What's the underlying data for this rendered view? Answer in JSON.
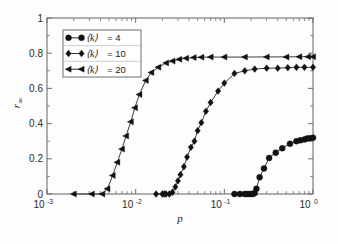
{
  "figure": {
    "background_color": "#fdfdfd",
    "axes_color": "#6f6f6f",
    "data_color": "#111111"
  },
  "chart_data": {
    "type": "line",
    "title": "",
    "subtitle": "",
    "xlabel": "p",
    "ylabel": "r",
    "ylabel_sub": "∞",
    "xscale": "log",
    "yscale": "linear",
    "xlim": [
      0.001,
      1.0
    ],
    "ylim": [
      0,
      1
    ],
    "grid": false,
    "legend_position": "upper-left",
    "xticks": [
      0.001,
      0.01,
      0.1,
      1
    ],
    "xticklabels": [
      "10",
      "10",
      "10",
      "10"
    ],
    "xtick_exponents": [
      "-3",
      "-2",
      "-1",
      "0"
    ],
    "yticks": [
      0,
      0.2,
      0.4,
      0.6,
      0.8,
      1
    ],
    "yticklabels": [
      "0",
      "0.2",
      "0.4",
      "0.6",
      "0.8",
      "1"
    ],
    "series": [
      {
        "name": "⟨k⟩ = 4",
        "legend_label": "= 4",
        "legend_k": "⟨k⟩",
        "marker": "circle",
        "x": [
          0.13,
          0.15,
          0.17,
          0.18,
          0.19,
          0.2,
          0.21,
          0.22,
          0.23,
          0.25,
          0.28,
          0.32,
          0.38,
          0.45,
          0.55,
          0.65,
          0.72,
          0.8,
          0.86,
          0.92,
          1.0
        ],
        "y": [
          0.0,
          0.0,
          0.0,
          0.0,
          0.0,
          0.0,
          0.0,
          0.005,
          0.03,
          0.095,
          0.145,
          0.205,
          0.235,
          0.26,
          0.285,
          0.3,
          0.305,
          0.31,
          0.315,
          0.317,
          0.32
        ]
      },
      {
        "name": "⟨k⟩ = 10",
        "legend_label": "= 10",
        "legend_k": "⟨k⟩",
        "marker": "diamond",
        "x": [
          0.017,
          0.02,
          0.021,
          0.022,
          0.024,
          0.026,
          0.028,
          0.03,
          0.032,
          0.035,
          0.038,
          0.042,
          0.046,
          0.05,
          0.055,
          0.062,
          0.07,
          0.085,
          0.1,
          0.13,
          0.17,
          0.22,
          0.3,
          0.4,
          0.52,
          0.65,
          0.8,
          1.0
        ],
        "y": [
          0.0,
          0.0,
          0.0,
          0.0,
          0.0,
          0.01,
          0.04,
          0.075,
          0.11,
          0.155,
          0.21,
          0.265,
          0.3,
          0.36,
          0.405,
          0.47,
          0.52,
          0.585,
          0.63,
          0.685,
          0.7,
          0.71,
          0.715,
          0.715,
          0.718,
          0.72,
          0.72,
          0.72
        ]
      },
      {
        "name": "⟨k⟩ = 20",
        "legend_label": "= 20",
        "legend_k": "⟨k⟩",
        "marker": "triangle-left",
        "x": [
          0.002,
          0.0032,
          0.0042,
          0.0048,
          0.0055,
          0.0062,
          0.007,
          0.0078,
          0.0088,
          0.0098,
          0.011,
          0.013,
          0.015,
          0.018,
          0.022,
          0.026,
          0.031,
          0.037,
          0.045,
          0.055,
          0.07,
          0.1,
          0.17,
          0.3,
          0.5,
          0.7,
          0.88,
          1.0
        ],
        "y": [
          0.0,
          0.0,
          0.0,
          0.03,
          0.105,
          0.18,
          0.255,
          0.33,
          0.41,
          0.49,
          0.565,
          0.645,
          0.69,
          0.72,
          0.745,
          0.755,
          0.765,
          0.772,
          0.775,
          0.777,
          0.778,
          0.778,
          0.778,
          0.779,
          0.779,
          0.78,
          0.78,
          0.78
        ]
      }
    ]
  }
}
